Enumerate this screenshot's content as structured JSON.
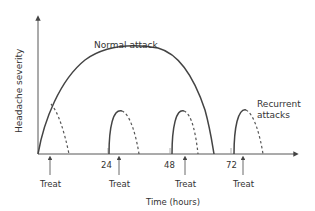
{
  "diagram": {
    "y_axis_label": "Headache severity",
    "x_axis_label": "Time (hours)",
    "normal_attack_label": "Normal attack",
    "recurrent_label_line1": "Recurrent",
    "recurrent_label_line2": "attacks",
    "ticks": [
      {
        "label": "24"
      },
      {
        "label": "48"
      },
      {
        "label": "72"
      }
    ],
    "treatments": [
      {
        "label": "Treat"
      },
      {
        "label": "Treat"
      },
      {
        "label": "Treat"
      },
      {
        "label": "Treat"
      }
    ],
    "colors": {
      "line": "#444444",
      "text": "#333333",
      "background": "#ffffff"
    }
  }
}
